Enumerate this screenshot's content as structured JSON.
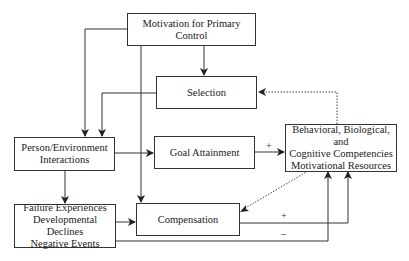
{
  "diagram": {
    "nodes": [
      {
        "id": "motivation",
        "lines": [
          "Motivation for Primary Control"
        ]
      },
      {
        "id": "selection",
        "lines": [
          "Selection"
        ]
      },
      {
        "id": "person_env",
        "lines": [
          "Person/Environment",
          "Interactions"
        ]
      },
      {
        "id": "goal",
        "lines": [
          "Goal Attainment"
        ]
      },
      {
        "id": "resources",
        "lines": [
          "Behavioral, Biological, and",
          "Cognitive Competencies",
          "Motivational Resources"
        ]
      },
      {
        "id": "failure",
        "lines": [
          "Failure Experiences",
          "Developmental Declines",
          "Negative Events"
        ]
      },
      {
        "id": "compensation",
        "lines": [
          "Compensation"
        ]
      }
    ],
    "edges": [
      {
        "from": "motivation",
        "to": "selection",
        "style": "solid"
      },
      {
        "from": "motivation",
        "to": "person_env",
        "style": "solid"
      },
      {
        "from": "motivation",
        "to": "compensation",
        "style": "solid"
      },
      {
        "from": "selection",
        "to": "person_env",
        "style": "solid"
      },
      {
        "from": "person_env",
        "to": "goal",
        "style": "solid"
      },
      {
        "from": "person_env",
        "to": "failure",
        "style": "solid"
      },
      {
        "from": "goal",
        "to": "resources",
        "style": "solid",
        "label": "+"
      },
      {
        "from": "resources",
        "to": "selection",
        "style": "dotted"
      },
      {
        "from": "resources",
        "to": "compensation",
        "style": "dotted"
      },
      {
        "from": "failure",
        "to": "compensation",
        "style": "solid"
      },
      {
        "from": "compensation",
        "to": "resources",
        "style": "solid",
        "label": "+"
      },
      {
        "from": "failure",
        "to": "resources",
        "style": "solid",
        "label": "–"
      }
    ],
    "signs": {
      "goal_plus": "+",
      "comp_plus": "+",
      "fail_minus": "–"
    }
  }
}
